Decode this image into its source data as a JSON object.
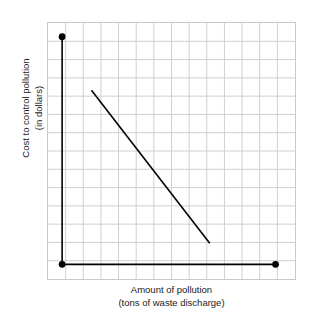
{
  "chart_data": {
    "type": "line",
    "title": "",
    "subtitle": "",
    "xlabel": "Amount of pollution",
    "xlabel_sub": "(tons of waste discharge)",
    "ylabel": "Cost to control pollution",
    "ylabel_sub": "(in dollars)",
    "xlim": [
      0,
      14
    ],
    "ylim": [
      0,
      14
    ],
    "grid": true,
    "grid_color": "#d0d0d0",
    "grid_columns": 14,
    "grid_rows": 14,
    "axis_color": "#000000",
    "legend": "none",
    "xtick_labels": [],
    "ytick_labels": [],
    "annotations": [],
    "series": [
      {
        "name": "axis-corner-markers",
        "type": "scatter",
        "marker": "filled-circle",
        "color": "#000000",
        "points": [
          {
            "x": 0.85,
            "y": 13.2,
            "label": "y-axis top endpoint"
          },
          {
            "x": 0.85,
            "y": 0.85,
            "label": "origin corner"
          },
          {
            "x": 12.85,
            "y": 0.85,
            "label": "x-axis right endpoint"
          }
        ]
      },
      {
        "name": "y-axis-segment",
        "type": "line",
        "color": "#000000",
        "points": [
          {
            "x": 0.85,
            "y": 13.2
          },
          {
            "x": 0.85,
            "y": 0.85
          }
        ]
      },
      {
        "name": "x-axis-segment",
        "type": "line",
        "color": "#000000",
        "points": [
          {
            "x": 0.85,
            "y": 0.85
          },
          {
            "x": 12.85,
            "y": 0.85
          }
        ]
      },
      {
        "name": "cost-curve",
        "type": "line",
        "color": "#000000",
        "description": "downward sloping cost line",
        "points": [
          {
            "x": 2.5,
            "y": 10.3
          },
          {
            "x": 9.15,
            "y": 2.0
          }
        ]
      }
    ]
  },
  "figure": {
    "xaxis": {
      "line1": "Amount of pollution",
      "line2": "(tons of waste discharge)"
    },
    "yaxis": {
      "line1": "Cost to control pollution",
      "line2": "(in dollars)"
    }
  }
}
